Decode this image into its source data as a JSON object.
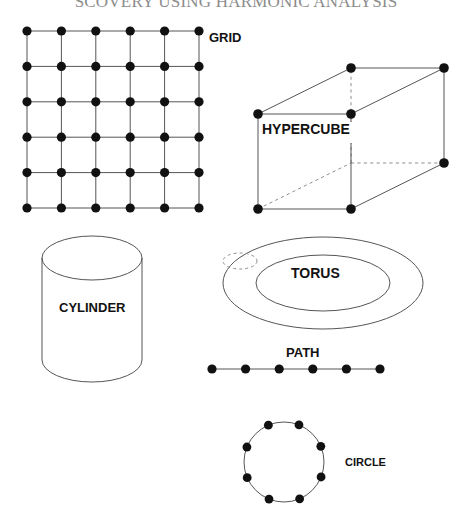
{
  "document": {
    "title_clipped": "SCOVERY USING HARMONIC ANALYSIS",
    "title_full": "DISCOVERY USING HARMONIC ANALYSIS",
    "background_color": "#ffffff",
    "ink_color": "#000000",
    "line_color": "#555555",
    "title_color": "#8c8c8c"
  },
  "figure": {
    "caption_style": "uppercase-bold-sans",
    "panels": [
      {
        "id": "grid",
        "label": "GRID",
        "label_x": 209,
        "label_y": 42,
        "label_size": 13,
        "type": "lattice-graph",
        "rows": 6,
        "cols": 6,
        "vertex_count": 36,
        "edge_count": 60,
        "x0": 27,
        "y0": 31,
        "x1": 199,
        "y1": 208,
        "dot_radius": 4.6
      },
      {
        "id": "hypercube",
        "label": "HYPERCUBE",
        "label_x": 262,
        "label_y": 134,
        "label_size": 14,
        "type": "cube-graph",
        "vertex_count": 8,
        "edge_count": 12,
        "hidden_edges": 3,
        "dot_radius": 4.8,
        "front_face": {
          "x": 258,
          "y": 114,
          "w": 93,
          "h": 95
        },
        "depth_dx": 93,
        "depth_dy": -46
      },
      {
        "id": "cylinder",
        "label": "CYLINDER",
        "label_x": 59,
        "label_y": 312,
        "label_size": 13,
        "type": "cylinder-surface",
        "cx": 92,
        "top_cy": 258,
        "bottom_cy": 360,
        "rx": 50,
        "ry": 22
      },
      {
        "id": "torus",
        "label": "TORUS",
        "label_x": 291,
        "label_y": 278,
        "label_size": 14,
        "type": "torus-surface",
        "cx": 323,
        "cy": 283,
        "outer_rx": 100,
        "outer_ry": 46,
        "inner_rx": 67,
        "inner_ry": 28,
        "tube_marker_dashed": true
      },
      {
        "id": "path",
        "label": "PATH",
        "label_x": 286,
        "label_y": 357,
        "label_size": 13,
        "type": "path-graph",
        "vertex_count": 6,
        "edge_count": 5,
        "y": 369,
        "x_start": 212,
        "x_end": 380,
        "dot_radius": 4.6
      },
      {
        "id": "circle",
        "label": "CIRCLE",
        "label_x": 345,
        "label_y": 466,
        "label_size": 11,
        "type": "cycle-graph",
        "vertex_count": 8,
        "edge_count": 8,
        "cx": 284,
        "cy": 462,
        "r": 40,
        "start_angle_deg": -68,
        "dot_radius": 4.4
      }
    ]
  }
}
